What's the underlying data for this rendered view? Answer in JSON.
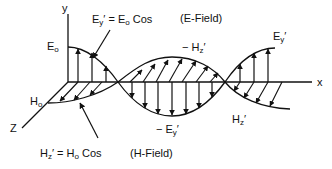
{
  "diagram": {
    "axes": {
      "y_label": "y",
      "x_label": "x",
      "z_label": "Z"
    },
    "labels": {
      "e_amplitude": "E",
      "e_amplitude_sub": "o",
      "h_amplitude": "H",
      "h_amplitude_sub": "o",
      "e_equation": "E",
      "e_equation_sub": "y",
      "e_equation_rest": "′ = E",
      "e_equation_sub2": "o",
      "e_equation_tail": " Cos",
      "e_field_name": "(E-Field)",
      "h_equation": "H",
      "h_equation_sub": "z",
      "h_equation_rest": "′ = H",
      "h_equation_sub2": "o",
      "h_equation_tail": " Cos",
      "h_field_name": "(H-Field)",
      "neg_hz": "− H",
      "neg_hz_sub": "z",
      "neg_hz_prime": "′",
      "neg_ey": "− E",
      "neg_ey_sub": "y",
      "neg_ey_prime": "′",
      "ey_peak": "E",
      "ey_peak_sub": "y",
      "ey_peak_prime": "′",
      "hz_peak": "H",
      "hz_peak_sub": "z",
      "hz_peak_prime": "′"
    },
    "colors": {
      "ink": "#111111",
      "background": "#ffffff"
    }
  }
}
